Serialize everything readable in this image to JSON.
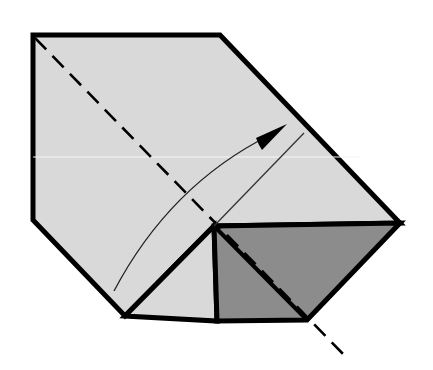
{
  "diagram": {
    "title": "Origami fold step",
    "colors": {
      "background": "#ffffff",
      "paper": "#d9d9d9",
      "paper_back": "#8c8c8c",
      "outline": "#000000",
      "crease_highlight": "#f5f5f5"
    },
    "shapes": {
      "main_paper": [
        [
          33,
          35
        ],
        [
          220,
          35
        ],
        [
          400,
          223
        ],
        [
          214,
          226
        ],
        [
          125,
          316
        ],
        [
          33,
          220
        ]
      ],
      "left_flap": [
        [
          125,
          316
        ],
        [
          214,
          226
        ],
        [
          217,
          321
        ]
      ],
      "dark_flap": [
        [
          214,
          226
        ],
        [
          400,
          223
        ],
        [
          307,
          320
        ],
        [
          217,
          321
        ]
      ],
      "inner_diagonal": [
        [
          214,
          226
        ],
        [
          307,
          320
        ]
      ]
    },
    "lines": {
      "valley_fold": {
        "from": [
          35,
          38
        ],
        "to": [
          346,
          357
        ],
        "style": "dashed"
      },
      "guide_line": {
        "from": [
          214,
          226
        ],
        "to": [
          304,
          133
        ],
        "style": "thin"
      },
      "move_arrow": {
        "from": [
          114,
          291
        ],
        "to": [
          287,
          124
        ],
        "style": "curved arrow"
      }
    }
  }
}
